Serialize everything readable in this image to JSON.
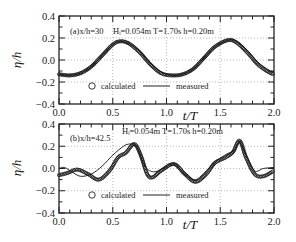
{
  "figure": {
    "xlabel": "t/T",
    "ylabel": "η/h",
    "x_ticks": [
      "0.0",
      "0.5",
      "1.0",
      "1.5",
      "2.0"
    ],
    "y_ticks": [
      "0.4",
      "0.2",
      "0.0",
      "-0.2",
      "-0.4"
    ],
    "legend": {
      "calculated": "calculated",
      "measured": "measured"
    }
  },
  "panels": [
    {
      "id": "a",
      "label": "(a)x/h=30",
      "params": "Hᵢ=0.054m  T=1.70s  h=0.20m"
    },
    {
      "id": "b",
      "label": "(b)x/h=42.5",
      "params": "Hᵢ=0.054m  T=1.70s  h=0.20m"
    }
  ],
  "chart_data": [
    {
      "type": "line",
      "title": "(a) x/h=30   Hi=0.054m  T=1.70s  h=0.20m",
      "xlabel": "t/T",
      "ylabel": "η/h",
      "xlim": [
        0.0,
        2.0
      ],
      "ylim": [
        -0.4,
        0.4
      ],
      "grid": true,
      "legend": [
        "calculated (circles)",
        "measured (line)"
      ],
      "legend_position": "lower center inside",
      "series": [
        {
          "name": "calculated",
          "marker": "circle",
          "x": [
            0.0,
            0.1,
            0.2,
            0.3,
            0.4,
            0.5,
            0.57,
            0.65,
            0.75,
            0.85,
            0.95,
            1.05,
            1.15,
            1.25,
            1.35,
            1.45,
            1.57,
            1.65,
            1.75,
            1.85,
            1.95,
            2.0
          ],
          "y": [
            -0.13,
            -0.14,
            -0.12,
            -0.06,
            0.04,
            0.14,
            0.17,
            0.15,
            0.07,
            -0.04,
            -0.12,
            -0.14,
            -0.13,
            -0.08,
            0.02,
            0.12,
            0.18,
            0.16,
            0.07,
            -0.04,
            -0.11,
            -0.13
          ]
        },
        {
          "name": "measured",
          "marker": "none",
          "x": [
            0.0,
            0.1,
            0.2,
            0.3,
            0.4,
            0.5,
            0.57,
            0.65,
            0.75,
            0.85,
            0.95,
            1.05,
            1.15,
            1.25,
            1.35,
            1.45,
            1.57,
            1.65,
            1.75,
            1.85,
            1.95,
            2.0
          ],
          "y": [
            -0.13,
            -0.14,
            -0.12,
            -0.06,
            0.04,
            0.14,
            0.17,
            0.15,
            0.08,
            -0.03,
            -0.11,
            -0.14,
            -0.13,
            -0.08,
            0.02,
            0.12,
            0.18,
            0.17,
            0.09,
            -0.02,
            -0.09,
            -0.11
          ]
        }
      ]
    },
    {
      "type": "line",
      "title": "(b) x/h=42.5   Hi=0.054m  T=1.70s  h=0.20m",
      "xlabel": "t/T",
      "ylabel": "η/h",
      "xlim": [
        0.0,
        2.0
      ],
      "ylim": [
        -0.4,
        0.4
      ],
      "grid": true,
      "legend": [
        "calculated (circles)",
        "measured (line)"
      ],
      "legend_position": "lower center inside",
      "series": [
        {
          "name": "calculated",
          "marker": "circle",
          "x": [
            0.0,
            0.08,
            0.17,
            0.27,
            0.37,
            0.47,
            0.55,
            0.62,
            0.7,
            0.76,
            0.82,
            0.87,
            0.95,
            1.07,
            1.17,
            1.27,
            1.37,
            1.45,
            1.55,
            1.62,
            1.68,
            1.74,
            1.82,
            1.9,
            2.0
          ],
          "y": [
            -0.06,
            -0.04,
            -0.01,
            -0.05,
            -0.1,
            -0.02,
            0.1,
            0.14,
            0.22,
            0.12,
            -0.05,
            -0.08,
            -0.02,
            0.04,
            -0.05,
            -0.12,
            -0.05,
            0.05,
            0.1,
            0.15,
            0.25,
            0.1,
            -0.05,
            -0.07,
            -0.02
          ]
        },
        {
          "name": "measured",
          "marker": "none",
          "x": [
            0.0,
            0.05,
            0.12,
            0.2,
            0.3,
            0.4,
            0.5,
            0.6,
            0.66,
            0.72,
            0.8,
            0.88,
            0.97,
            1.07,
            1.17,
            1.27,
            1.37,
            1.47,
            1.56,
            1.63,
            1.68,
            1.74,
            1.82,
            1.9,
            2.0
          ],
          "y": [
            0.0,
            0.01,
            -0.03,
            -0.07,
            -0.05,
            0.02,
            0.12,
            0.2,
            0.22,
            0.2,
            0.02,
            -0.03,
            0.0,
            0.04,
            -0.05,
            -0.1,
            -0.02,
            0.07,
            0.13,
            0.16,
            0.24,
            0.12,
            -0.02,
            0.0,
            0.01
          ]
        }
      ]
    }
  ]
}
